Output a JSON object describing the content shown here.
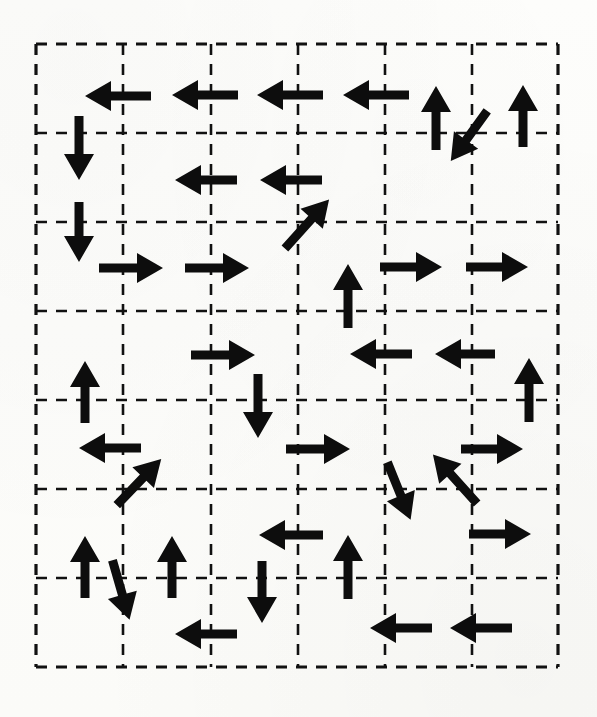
{
  "figure": {
    "name": "vector-field-grid-diagram",
    "background_color": "#fdfdfb",
    "ink_color": "#0d0d0d",
    "grid": {
      "x_left": 36,
      "x_right": 558,
      "y_top": 44,
      "y_bottom": 667,
      "columns": 6,
      "rows": 7,
      "cell_width": 87,
      "cell_height": 89,
      "vertical_line_x": [
        36,
        123,
        211,
        298,
        385,
        472,
        558
      ],
      "horizontal_line_y": [
        44,
        133,
        222,
        311,
        400,
        489,
        578,
        667
      ],
      "line_style": "dashed",
      "line_color": "#111111",
      "line_width": 2.6,
      "dash_pattern": "11 9",
      "border_line_width": 3.2
    },
    "arrow_style": {
      "shaft_width": 9,
      "head_length": 26,
      "head_half_width": 15,
      "default_length": 62,
      "color": "#0d0d0d"
    },
    "arrows": [
      {
        "id": "a01",
        "x": 118,
        "y": 96,
        "angle": 180,
        "length": 66,
        "note": "left"
      },
      {
        "id": "a02",
        "x": 205,
        "y": 95,
        "angle": 180,
        "length": 66,
        "note": "left"
      },
      {
        "id": "a03",
        "x": 290,
        "y": 95,
        "angle": 180,
        "length": 66,
        "note": "left"
      },
      {
        "id": "a04",
        "x": 376,
        "y": 95,
        "angle": 180,
        "length": 66,
        "note": "left"
      },
      {
        "id": "a05",
        "x": 436,
        "y": 118,
        "angle": 90,
        "length": 64,
        "note": "up"
      },
      {
        "id": "a06",
        "x": 469,
        "y": 136,
        "angle": 234,
        "length": 62,
        "note": "down-left diagonal"
      },
      {
        "id": "a07",
        "x": 523,
        "y": 116,
        "angle": 90,
        "length": 62,
        "note": "up"
      },
      {
        "id": "a08",
        "x": 79,
        "y": 148,
        "angle": 270,
        "length": 64,
        "note": "down"
      },
      {
        "id": "a09",
        "x": 206,
        "y": 180,
        "angle": 180,
        "length": 62,
        "note": "left"
      },
      {
        "id": "a10",
        "x": 291,
        "y": 180,
        "angle": 180,
        "length": 62,
        "note": "left"
      },
      {
        "id": "a11",
        "x": 79,
        "y": 232,
        "angle": 270,
        "length": 60,
        "note": "down"
      },
      {
        "id": "a12",
        "x": 307,
        "y": 224,
        "angle": 48,
        "length": 66,
        "note": "up-right diagonal"
      },
      {
        "id": "a13",
        "x": 131,
        "y": 268,
        "angle": 0,
        "length": 64,
        "note": "right"
      },
      {
        "id": "a14",
        "x": 217,
        "y": 268,
        "angle": 0,
        "length": 64,
        "note": "right"
      },
      {
        "id": "a15",
        "x": 348,
        "y": 296,
        "angle": 90,
        "length": 64,
        "note": "up"
      },
      {
        "id": "a16",
        "x": 411,
        "y": 267,
        "angle": 0,
        "length": 62,
        "note": "right"
      },
      {
        "id": "a17",
        "x": 497,
        "y": 267,
        "angle": 0,
        "length": 62,
        "note": "right"
      },
      {
        "id": "a18",
        "x": 223,
        "y": 355,
        "angle": 0,
        "length": 64,
        "note": "right"
      },
      {
        "id": "a19",
        "x": 381,
        "y": 354,
        "angle": 180,
        "length": 62,
        "note": "left"
      },
      {
        "id": "a20",
        "x": 465,
        "y": 354,
        "angle": 180,
        "length": 60,
        "note": "left"
      },
      {
        "id": "a21",
        "x": 85,
        "y": 392,
        "angle": 90,
        "length": 62,
        "note": "up"
      },
      {
        "id": "a22",
        "x": 529,
        "y": 390,
        "angle": 90,
        "length": 64,
        "note": "up"
      },
      {
        "id": "a23",
        "x": 258,
        "y": 406,
        "angle": 270,
        "length": 64,
        "note": "down"
      },
      {
        "id": "a24",
        "x": 110,
        "y": 448,
        "angle": 180,
        "length": 62,
        "note": "left"
      },
      {
        "id": "a25",
        "x": 318,
        "y": 449,
        "angle": 0,
        "length": 64,
        "note": "right"
      },
      {
        "id": "a26",
        "x": 492,
        "y": 449,
        "angle": 0,
        "length": 62,
        "note": "right"
      },
      {
        "id": "a27",
        "x": 139,
        "y": 482,
        "angle": 46,
        "length": 64,
        "note": "up-right diagonal"
      },
      {
        "id": "a28",
        "x": 399,
        "y": 491,
        "angle": 292,
        "length": 62,
        "note": "down-right diagonal"
      },
      {
        "id": "a29",
        "x": 455,
        "y": 479,
        "angle": 132,
        "length": 66,
        "note": "up-left diagonal"
      },
      {
        "id": "a30",
        "x": 291,
        "y": 535,
        "angle": 180,
        "length": 64,
        "note": "left"
      },
      {
        "id": "a31",
        "x": 500,
        "y": 534,
        "angle": 0,
        "length": 62,
        "note": "right"
      },
      {
        "id": "a32",
        "x": 85,
        "y": 567,
        "angle": 90,
        "length": 62,
        "note": "up"
      },
      {
        "id": "a33",
        "x": 172,
        "y": 567,
        "angle": 90,
        "length": 62,
        "note": "up"
      },
      {
        "id": "a34",
        "x": 348,
        "y": 567,
        "angle": 90,
        "length": 64,
        "note": "up"
      },
      {
        "id": "a35",
        "x": 121,
        "y": 590,
        "angle": 286,
        "length": 62,
        "note": "down-left-ish diagonal"
      },
      {
        "id": "a36",
        "x": 262,
        "y": 592,
        "angle": 270,
        "length": 62,
        "note": "down"
      },
      {
        "id": "a37",
        "x": 206,
        "y": 634,
        "angle": 180,
        "length": 62,
        "note": "left"
      },
      {
        "id": "a38",
        "x": 401,
        "y": 628,
        "angle": 180,
        "length": 62,
        "note": "left"
      },
      {
        "id": "a39",
        "x": 481,
        "y": 628,
        "angle": 180,
        "length": 62,
        "note": "left"
      }
    ]
  }
}
